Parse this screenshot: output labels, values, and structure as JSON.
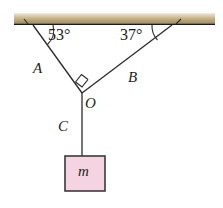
{
  "figure": {
    "width": 223,
    "height": 208,
    "background": "#ffffff"
  },
  "beam": {
    "name": "ceiling-beam",
    "x": 14,
    "y": 13,
    "width": 201,
    "height": 11,
    "color_top": "#efe9da",
    "color_mid": "#c8b48c",
    "color_bottom": "#a08e66",
    "edge_color": "#1a1a1a"
  },
  "ropes": [
    {
      "id": "A",
      "label": "A",
      "x1": 33,
      "y1": 28,
      "x2": 82,
      "y2": 93,
      "color": "#2b2b2b",
      "label_x": 33,
      "label_y": 61
    },
    {
      "id": "B",
      "label": "B",
      "x1": 172,
      "y1": 28,
      "x2": 82,
      "y2": 93,
      "color": "#2b2b2b",
      "label_x": 128,
      "label_y": 70
    },
    {
      "id": "C",
      "label": "C",
      "x1": 82,
      "y1": 93,
      "x2": 82,
      "y2": 156,
      "color": "#2b2b2b",
      "label_x": 58,
      "label_y": 119
    }
  ],
  "angles": [
    {
      "id": "left-angle",
      "value": "53",
      "text": "53°",
      "vertex_x": 33,
      "vertex_y": 28,
      "text_x": 48,
      "text_y": 27
    },
    {
      "id": "right-angle-37",
      "value": "37",
      "text": "37°",
      "vertex_x": 172,
      "vertex_y": 28,
      "text_x": 120,
      "text_y": 27
    }
  ],
  "junction": {
    "name": "knot-O",
    "label": "O",
    "x": 82,
    "y": 93,
    "label_x": 85,
    "label_y": 96,
    "right_angle_marker": true,
    "right_angle_marker_note": "square symbol between rope A and rope B at O"
  },
  "block": {
    "name": "hanging-mass",
    "label": "m",
    "x": 65,
    "y": 156,
    "width": 40,
    "height": 35,
    "fill": "#f4d4e0",
    "stroke": "#3a3a3a",
    "label_x": 78,
    "label_y": 164
  }
}
